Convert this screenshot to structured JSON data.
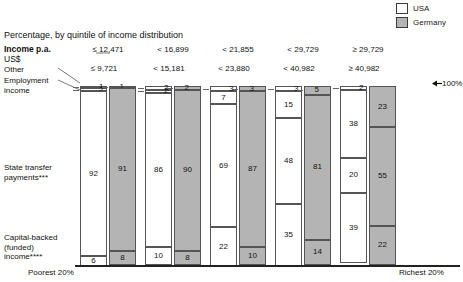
{
  "legend": {
    "items": [
      {
        "label": "USA",
        "color": "#ffffff",
        "icon": "white-square-swatch"
      },
      {
        "label": "Germany",
        "color": "#b4b4b4",
        "icon": "gray-square-swatch"
      }
    ]
  },
  "header": {
    "title": "Percentage, by quintile of income distribution",
    "income_label": "Income p.a.",
    "income_unit": "US$",
    "marker_100": "100%"
  },
  "categories_legend": {
    "other": "Other",
    "employment_line1": "Employment",
    "employment_line2": "income",
    "state_line1": "State transfer",
    "state_line2": "payments***",
    "capital_line1": "Capital-backed",
    "capital_line2": "(funded)",
    "capital_line3": "income****"
  },
  "axis": {
    "left": "Poorest 20%",
    "right": "Richest 20%"
  },
  "chart_data": {
    "type": "bar",
    "title": "Percentage, by quintile of income distribution",
    "xlabel": "",
    "ylabel": "",
    "ylim": [
      0,
      100
    ],
    "grid": false,
    "legend_position": "top-right",
    "stacked": true,
    "components": [
      "Other",
      "Employment income",
      "State transfer payments***",
      "Capital-backed (funded) income****"
    ],
    "categories": [
      "Poorest 20%",
      "2nd quintile",
      "3rd quintile",
      "4th quintile",
      "Richest 20%"
    ],
    "income_bands": [
      {
        "usa": "≤ 12,471",
        "germany": "≤ 9,721"
      },
      {
        "usa": "< 16,899",
        "germany": "< 15,181"
      },
      {
        "usa": "< 21,855",
        "germany": "< 23,880"
      },
      {
        "usa": "< 29,729",
        "germany": "< 40,982"
      },
      {
        "usa": "≥ 29,729",
        "germany": "≥ 40,982"
      }
    ],
    "series": [
      {
        "name": "USA",
        "color": "#ffffff",
        "quintiles": [
          {
            "other": 1,
            "employment": 2,
            "state": 92,
            "capital": 6
          },
          {
            "other": 2,
            "employment": 2,
            "state": 86,
            "capital": 10
          },
          {
            "other": 3,
            "employment": 7,
            "state": 69,
            "capital": 22
          },
          {
            "other": 3,
            "employment": 15,
            "state": 48,
            "capital": 35
          },
          {
            "other": 2,
            "employment": 38,
            "state": 20,
            "capital": 39
          }
        ]
      },
      {
        "name": "Germany",
        "color": "#b4b4b4",
        "quintiles": [
          {
            "other": 1,
            "employment": 0,
            "state": 91,
            "capital": 8
          },
          {
            "other": 2,
            "employment": 0,
            "state": 90,
            "capital": 8
          },
          {
            "other": 3,
            "employment": 0,
            "state": 87,
            "capital": 10
          },
          {
            "other": 5,
            "employment": 0,
            "state": 81,
            "capital": 14
          },
          {
            "other": 0,
            "employment": 23,
            "state": 55,
            "capital": 22
          }
        ]
      }
    ]
  }
}
